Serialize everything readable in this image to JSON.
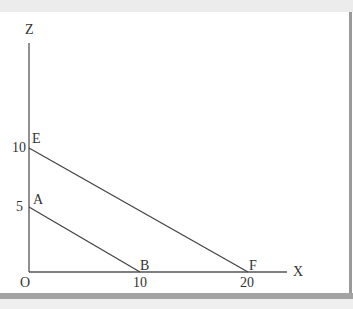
{
  "diagram": {
    "axes": {
      "x_label": "X",
      "z_label": "Z",
      "origin_label": "O"
    },
    "ticks": {
      "x": [
        "10",
        "20"
      ],
      "z": [
        "5",
        "10"
      ]
    },
    "points": {
      "A": "A",
      "B": "B",
      "E": "E",
      "F": "F"
    },
    "lines": [
      {
        "name": "AB",
        "from": [
          0,
          5
        ],
        "to": [
          10,
          0
        ]
      },
      {
        "name": "EF",
        "from": [
          0,
          10
        ],
        "to": [
          20,
          0
        ]
      }
    ],
    "line_color": "#444444"
  }
}
